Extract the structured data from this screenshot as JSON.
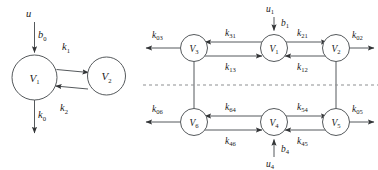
{
  "figure": {
    "background_color": "#ffffff",
    "stroke_color": "#55595c",
    "text_color": "#1a1a1a",
    "divider_color": "#8d8f91"
  },
  "panels": [
    {
      "id": "left-panel",
      "name": "two-compartment-model",
      "nodes": [
        {
          "id": "L-V1",
          "label": "V",
          "sub": "1",
          "cx": 34.5,
          "cy": 77.5,
          "r": 22.5
        },
        {
          "id": "L-V2",
          "label": "V",
          "sub": "2",
          "cx": 106.5,
          "cy": 76.0,
          "r": 19.0
        }
      ],
      "edge_labels": [
        {
          "id": "L-u",
          "label": "u",
          "sub": "",
          "x": 26.0,
          "y": 17.0
        },
        {
          "id": "L-b0",
          "label": "b",
          "sub": "0",
          "x": 38.0,
          "y": 38.0
        },
        {
          "id": "L-k1",
          "label": "k",
          "sub": "1",
          "x": 62.0,
          "y": 50.0
        },
        {
          "id": "L-k2",
          "label": "k",
          "sub": "2",
          "x": 60.0,
          "y": 111.0
        },
        {
          "id": "L-k0",
          "label": "k",
          "sub": "0",
          "x": 38.0,
          "y": 118.0
        }
      ]
    },
    {
      "id": "right-panel",
      "name": "six-compartment-model",
      "nodes": [
        {
          "id": "R-V3",
          "label": "V",
          "sub": "3",
          "cx": 194.0,
          "cy": 48.0,
          "r": 13.5
        },
        {
          "id": "R-V1",
          "label": "V",
          "sub": "1",
          "cx": 274.0,
          "cy": 48.0,
          "r": 13.5
        },
        {
          "id": "R-V2",
          "label": "V",
          "sub": "2",
          "cx": 336.0,
          "cy": 48.0,
          "r": 13.5
        },
        {
          "id": "R-V6",
          "label": "V",
          "sub": "6",
          "cx": 194.0,
          "cy": 122.0,
          "r": 13.5
        },
        {
          "id": "R-V4",
          "label": "V",
          "sub": "4",
          "cx": 274.0,
          "cy": 122.0,
          "r": 13.5
        },
        {
          "id": "R-V5",
          "label": "V",
          "sub": "5",
          "cx": 336.0,
          "cy": 122.0,
          "r": 13.5
        }
      ],
      "edge_labels": [
        {
          "id": "R-u1",
          "label": "u",
          "sub": "1",
          "x": 266.0,
          "y": 12.0
        },
        {
          "id": "R-b1",
          "label": "b",
          "sub": "1",
          "x": 281.0,
          "y": 26.0
        },
        {
          "id": "R-k03",
          "label": "k",
          "sub": "03",
          "x": 152.0,
          "y": 38.0
        },
        {
          "id": "R-k31",
          "label": "k",
          "sub": "31",
          "x": 225.0,
          "y": 36.0
        },
        {
          "id": "R-k21",
          "label": "k",
          "sub": "21",
          "x": 297.0,
          "y": 36.0
        },
        {
          "id": "R-k02",
          "label": "k",
          "sub": "02",
          "x": 352.0,
          "y": 36.0
        },
        {
          "id": "R-k13",
          "label": "k",
          "sub": "13",
          "x": 225.0,
          "y": 70.0
        },
        {
          "id": "R-k12",
          "label": "k",
          "sub": "12",
          "x": 297.0,
          "y": 70.0
        },
        {
          "id": "R-k06",
          "label": "k",
          "sub": "06",
          "x": 152.0,
          "y": 112.0
        },
        {
          "id": "R-k64",
          "label": "k",
          "sub": "64",
          "x": 225.0,
          "y": 110.0
        },
        {
          "id": "R-k54",
          "label": "k",
          "sub": "54",
          "x": 297.0,
          "y": 110.0
        },
        {
          "id": "R-k05",
          "label": "k",
          "sub": "05",
          "x": 352.0,
          "y": 110.0
        },
        {
          "id": "R-k46",
          "label": "k",
          "sub": "46",
          "x": 225.0,
          "y": 144.0
        },
        {
          "id": "R-k45",
          "label": "k",
          "sub": "45",
          "x": 297.0,
          "y": 144.0
        },
        {
          "id": "R-b4",
          "label": "b",
          "sub": "4",
          "x": 281.0,
          "y": 152.0
        },
        {
          "id": "R-u4",
          "label": "u",
          "sub": "4",
          "x": 266.0,
          "y": 167.0
        }
      ]
    }
  ]
}
